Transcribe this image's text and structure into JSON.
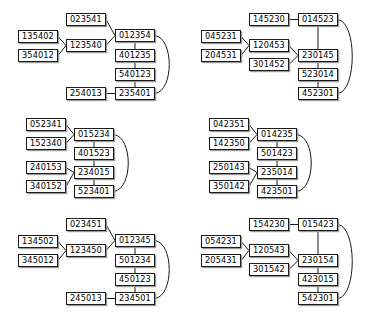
{
  "figure": {
    "type": "lattice-diagram-grid",
    "background_color": "#ffffff",
    "node_border_color": "#1a1a1a",
    "node_fill_color": "#ffffff",
    "node_shadow_color": "#9a9a9a",
    "edge_color": "#1a1a1a",
    "rows": 3,
    "columns": 2,
    "panel_count": 6
  },
  "panels": [
    {
      "id": "panel-1",
      "nodes": [
        {
          "id": "p1n1",
          "label": "135402",
          "x": 4,
          "y": 28
        },
        {
          "id": "p1n2",
          "label": "354012",
          "x": 4,
          "y": 47
        },
        {
          "id": "p1n3",
          "label": "023541",
          "x": 52,
          "y": 11
        },
        {
          "id": "p1n4",
          "label": "123540",
          "x": 52,
          "y": 37
        },
        {
          "id": "p1n5",
          "label": "012354",
          "x": 101,
          "y": 27
        },
        {
          "id": "p1n6",
          "label": "401235",
          "x": 101,
          "y": 47
        },
        {
          "id": "p1n7",
          "label": "540123",
          "x": 101,
          "y": 66
        },
        {
          "id": "p1n8",
          "label": "235401",
          "x": 101,
          "y": 85
        },
        {
          "id": "p1n9",
          "label": "254013",
          "x": 52,
          "y": 85
        }
      ],
      "edges": [
        {
          "from": "p1n1",
          "to": "p1n4",
          "kind": "straight"
        },
        {
          "from": "p1n2",
          "to": "p1n4",
          "kind": "straight"
        },
        {
          "from": "p1n3",
          "to": "p1n5",
          "kind": "straight"
        },
        {
          "from": "p1n4",
          "to": "p1n5",
          "kind": "straight"
        },
        {
          "from": "p1n5",
          "to": "p1n6",
          "kind": "straight"
        },
        {
          "from": "p1n6",
          "to": "p1n7",
          "kind": "straight"
        },
        {
          "from": "p1n7",
          "to": "p1n8",
          "kind": "straight"
        },
        {
          "from": "p1n9",
          "to": "p1n8",
          "kind": "straight"
        },
        {
          "from": "p1n5",
          "to": "p1n8",
          "kind": "curve-right"
        }
      ]
    },
    {
      "id": "panel-2",
      "nodes": [
        {
          "id": "p2n1",
          "label": "045231",
          "x": 4,
          "y": 28
        },
        {
          "id": "p2n2",
          "label": "204531",
          "x": 4,
          "y": 47
        },
        {
          "id": "p2n3",
          "label": "145230",
          "x": 52,
          "y": 11
        },
        {
          "id": "p2n4",
          "label": "120453",
          "x": 52,
          "y": 37
        },
        {
          "id": "p2n5",
          "label": "301452",
          "x": 52,
          "y": 56
        },
        {
          "id": "p2n6",
          "label": "014523",
          "x": 101,
          "y": 11
        },
        {
          "id": "p2n7",
          "label": "230145",
          "x": 101,
          "y": 47
        },
        {
          "id": "p2n8",
          "label": "523014",
          "x": 101,
          "y": 66
        },
        {
          "id": "p2n9",
          "label": "452301",
          "x": 101,
          "y": 85
        }
      ],
      "edges": [
        {
          "from": "p2n1",
          "to": "p2n4",
          "kind": "straight"
        },
        {
          "from": "p2n2",
          "to": "p2n4",
          "kind": "straight"
        },
        {
          "from": "p2n3",
          "to": "p2n6",
          "kind": "straight"
        },
        {
          "from": "p2n4",
          "to": "p2n7",
          "kind": "straight"
        },
        {
          "from": "p2n5",
          "to": "p2n7",
          "kind": "straight"
        },
        {
          "from": "p2n6",
          "to": "p2n7",
          "kind": "straight"
        },
        {
          "from": "p2n7",
          "to": "p2n8",
          "kind": "straight"
        },
        {
          "from": "p2n8",
          "to": "p2n9",
          "kind": "straight"
        },
        {
          "from": "p2n6",
          "to": "p2n9",
          "kind": "curve-right"
        }
      ]
    },
    {
      "id": "panel-3",
      "nodes": [
        {
          "id": "p3n1",
          "label": "052341",
          "x": 4,
          "y": 11
        },
        {
          "id": "p3n2",
          "label": "152340",
          "x": 4,
          "y": 30
        },
        {
          "id": "p3n3",
          "label": "240153",
          "x": 4,
          "y": 54
        },
        {
          "id": "p3n4",
          "label": "340152",
          "x": 4,
          "y": 73
        },
        {
          "id": "p3n5",
          "label": "015234",
          "x": 52,
          "y": 21
        },
        {
          "id": "p3n6",
          "label": "401523",
          "x": 52,
          "y": 40
        },
        {
          "id": "p3n7",
          "label": "234015",
          "x": 52,
          "y": 59
        },
        {
          "id": "p3n8",
          "label": "523401",
          "x": 52,
          "y": 78
        }
      ],
      "edges": [
        {
          "from": "p3n1",
          "to": "p3n5",
          "kind": "straight"
        },
        {
          "from": "p3n2",
          "to": "p3n5",
          "kind": "straight"
        },
        {
          "from": "p3n3",
          "to": "p3n7",
          "kind": "straight"
        },
        {
          "from": "p3n4",
          "to": "p3n7",
          "kind": "straight"
        },
        {
          "from": "p3n5",
          "to": "p3n6",
          "kind": "straight"
        },
        {
          "from": "p3n6",
          "to": "p3n7",
          "kind": "straight"
        },
        {
          "from": "p3n7",
          "to": "p3n8",
          "kind": "straight"
        },
        {
          "from": "p3n5",
          "to": "p3n8",
          "kind": "curve-right"
        }
      ]
    },
    {
      "id": "panel-4",
      "nodes": [
        {
          "id": "p4n1",
          "label": "042351",
          "x": 4,
          "y": 11
        },
        {
          "id": "p4n2",
          "label": "142350",
          "x": 4,
          "y": 30
        },
        {
          "id": "p4n3",
          "label": "250143",
          "x": 4,
          "y": 54
        },
        {
          "id": "p4n4",
          "label": "350142",
          "x": 4,
          "y": 73
        },
        {
          "id": "p4n5",
          "label": "014235",
          "x": 52,
          "y": 21
        },
        {
          "id": "p4n6",
          "label": "501423",
          "x": 52,
          "y": 40
        },
        {
          "id": "p4n7",
          "label": "235014",
          "x": 52,
          "y": 59
        },
        {
          "id": "p4n8",
          "label": "423501",
          "x": 52,
          "y": 78
        }
      ],
      "edges": [
        {
          "from": "p4n1",
          "to": "p4n5",
          "kind": "straight"
        },
        {
          "from": "p4n2",
          "to": "p4n5",
          "kind": "straight"
        },
        {
          "from": "p4n3",
          "to": "p4n7",
          "kind": "straight"
        },
        {
          "from": "p4n4",
          "to": "p4n7",
          "kind": "straight"
        },
        {
          "from": "p4n5",
          "to": "p4n6",
          "kind": "straight"
        },
        {
          "from": "p4n6",
          "to": "p4n7",
          "kind": "straight"
        },
        {
          "from": "p4n7",
          "to": "p4n8",
          "kind": "straight"
        },
        {
          "from": "p4n5",
          "to": "p4n8",
          "kind": "curve-right"
        }
      ]
    },
    {
      "id": "panel-5",
      "nodes": [
        {
          "id": "p5n1",
          "label": "134502",
          "x": 4,
          "y": 28
        },
        {
          "id": "p5n2",
          "label": "345012",
          "x": 4,
          "y": 47
        },
        {
          "id": "p5n3",
          "label": "023451",
          "x": 52,
          "y": 11
        },
        {
          "id": "p5n4",
          "label": "123450",
          "x": 52,
          "y": 37
        },
        {
          "id": "p5n5",
          "label": "012345",
          "x": 101,
          "y": 27
        },
        {
          "id": "p5n6",
          "label": "501234",
          "x": 101,
          "y": 47
        },
        {
          "id": "p5n7",
          "label": "450123",
          "x": 101,
          "y": 66
        },
        {
          "id": "p5n8",
          "label": "234501",
          "x": 101,
          "y": 85
        },
        {
          "id": "p5n9",
          "label": "245013",
          "x": 52,
          "y": 85
        }
      ],
      "edges": [
        {
          "from": "p5n1",
          "to": "p5n4",
          "kind": "straight"
        },
        {
          "from": "p5n2",
          "to": "p5n4",
          "kind": "straight"
        },
        {
          "from": "p5n3",
          "to": "p5n5",
          "kind": "straight"
        },
        {
          "from": "p5n4",
          "to": "p5n5",
          "kind": "straight"
        },
        {
          "from": "p5n5",
          "to": "p5n6",
          "kind": "straight"
        },
        {
          "from": "p5n6",
          "to": "p5n7",
          "kind": "straight"
        },
        {
          "from": "p5n7",
          "to": "p5n8",
          "kind": "straight"
        },
        {
          "from": "p5n9",
          "to": "p5n8",
          "kind": "straight"
        },
        {
          "from": "p5n5",
          "to": "p5n8",
          "kind": "curve-right"
        }
      ]
    },
    {
      "id": "panel-6",
      "nodes": [
        {
          "id": "p6n1",
          "label": "054231",
          "x": 4,
          "y": 28
        },
        {
          "id": "p6n2",
          "label": "205431",
          "x": 4,
          "y": 47
        },
        {
          "id": "p6n3",
          "label": "154230",
          "x": 52,
          "y": 11
        },
        {
          "id": "p6n4",
          "label": "120543",
          "x": 52,
          "y": 37
        },
        {
          "id": "p6n5",
          "label": "301542",
          "x": 52,
          "y": 56
        },
        {
          "id": "p6n6",
          "label": "015423",
          "x": 101,
          "y": 11
        },
        {
          "id": "p6n7",
          "label": "230154",
          "x": 101,
          "y": 47
        },
        {
          "id": "p6n8",
          "label": "423015",
          "x": 101,
          "y": 66
        },
        {
          "id": "p6n9",
          "label": "542301",
          "x": 101,
          "y": 85
        }
      ],
      "edges": [
        {
          "from": "p6n1",
          "to": "p6n4",
          "kind": "straight"
        },
        {
          "from": "p6n2",
          "to": "p6n4",
          "kind": "straight"
        },
        {
          "from": "p6n3",
          "to": "p6n6",
          "kind": "straight"
        },
        {
          "from": "p6n4",
          "to": "p6n7",
          "kind": "straight"
        },
        {
          "from": "p6n5",
          "to": "p6n7",
          "kind": "straight"
        },
        {
          "from": "p6n6",
          "to": "p6n7",
          "kind": "straight"
        },
        {
          "from": "p6n7",
          "to": "p6n8",
          "kind": "straight"
        },
        {
          "from": "p6n8",
          "to": "p6n9",
          "kind": "straight"
        },
        {
          "from": "p6n6",
          "to": "p6n9",
          "kind": "curve-right"
        }
      ]
    }
  ],
  "panel_origins": [
    {
      "id": "panel-1",
      "x": 14,
      "y": 2
    },
    {
      "id": "panel-2",
      "x": 197,
      "y": 2
    },
    {
      "id": "panel-3",
      "x": 22,
      "y": 107
    },
    {
      "id": "panel-4",
      "x": 205,
      "y": 107
    },
    {
      "id": "panel-5",
      "x": 14,
      "y": 207
    },
    {
      "id": "panel-6",
      "x": 197,
      "y": 207
    }
  ]
}
